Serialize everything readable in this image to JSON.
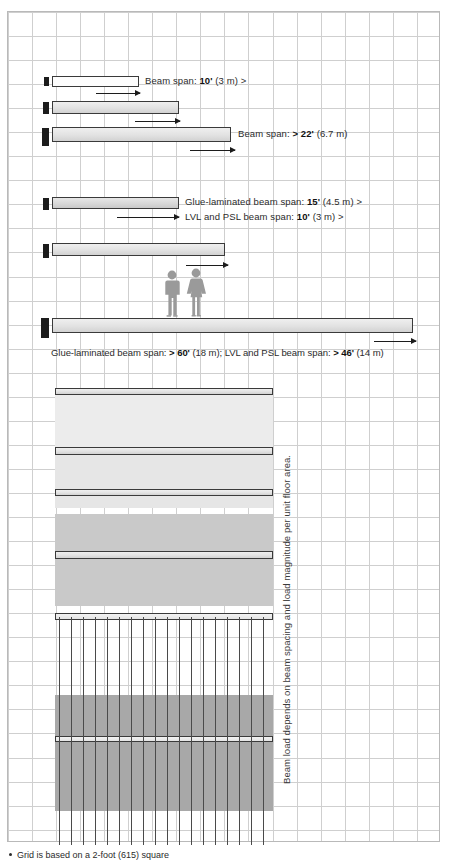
{
  "figure": {
    "footnote": "Grid is based on a 2-foot (615) square",
    "vertical_note": "Beam load depends on beam spacing and load magnitude per unit floor area.",
    "grid": {
      "cell_px": 24,
      "cell_label": "2-foot (615) square",
      "color": "#cfcfcf",
      "border_color": "#b9b9b9"
    },
    "colors": {
      "beam_outline": "#3a3a3a",
      "support": "#1c1c1c",
      "band_light": "#eaeaea",
      "band_mid": "#dcdcdc",
      "band_dark": "#c6c6c6",
      "text": "#2b2b2b",
      "people": "#9a9a9a"
    }
  },
  "beams": [
    {
      "id": "beam-1",
      "label": "Beam span: 10' (3 m) >",
      "label_plain": "Beam span:",
      "label_value": "10'",
      "label_metric": "(3 m) >",
      "span_feet": 10,
      "span_metric": "3 m",
      "depth_class": "shallow",
      "fill": "light"
    },
    {
      "id": "beam-2",
      "label": "",
      "span_feet": 14,
      "span_metric": "",
      "depth_class": "medium",
      "fill": "med"
    },
    {
      "id": "beam-3",
      "label": "Beam span: > 22' (6.7 m)",
      "label_plain": "Beam span:",
      "label_value": "> 22'",
      "label_metric": "(6.7 m)",
      "span_feet": 22,
      "span_metric": "6.7 m",
      "depth_class": "deep",
      "fill": "med"
    },
    {
      "id": "beam-4",
      "label_line1": "Glue-laminated beam span: 15' (4.5 m) >",
      "label_line1_plain": "Glue-laminated beam span:",
      "label_line1_value": "15'",
      "label_line1_metric": "(4.5 m) >",
      "label_line2": "LVL and PSL beam span: 10' (3 m) >",
      "label_line2_plain": "LVL and PSL beam span:",
      "label_line2_value": "10'",
      "label_line2_metric": "(3 m) >",
      "fill": "dark"
    },
    {
      "id": "beam-5",
      "label": "",
      "fill": "med"
    },
    {
      "id": "beam-6",
      "caption_plain_a": "Glue-laminated beam span:",
      "caption_value_a": "> 60'",
      "caption_metric_a": "(18 m);",
      "caption_plain_b": "LVL and PSL beam span:",
      "caption_value_b": "> 46'",
      "caption_metric_b": "(14 m)",
      "fill": "med"
    }
  ],
  "captions": {
    "long_span": "Glue-laminated beam span: > 60' (18 m); LVL and PSL beam span: > 46' (14 m)"
  },
  "tributary_panels": [
    {
      "id": "panel-1",
      "shade": "#ececec",
      "note": "narrow beam spacing, light tributary load"
    },
    {
      "id": "panel-2",
      "shade": "#e4e4e4",
      "note": "wider beam spacing"
    },
    {
      "id": "panel-3",
      "shade": "#ffffff",
      "note": "no shading"
    },
    {
      "id": "panel-4",
      "shade": "#c9c9c9",
      "note": "wide spacing, heavy tributary load"
    },
    {
      "id": "panel-5",
      "shade": "#a8a8a8",
      "note": "joisted framing, heaviest tributary load"
    }
  ],
  "people": {
    "count": 2,
    "labels": [
      "figure-male",
      "figure-female"
    ],
    "scale_note": "human scale reference standing on long-span beam"
  }
}
